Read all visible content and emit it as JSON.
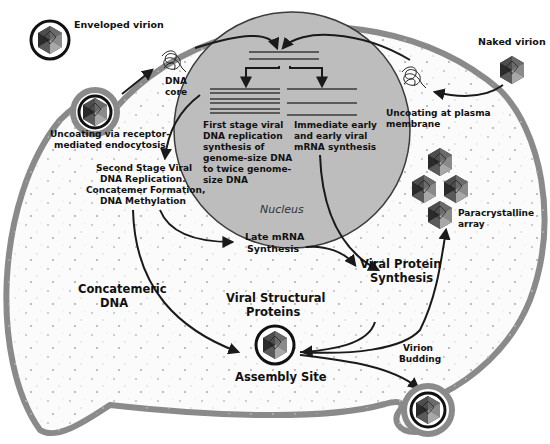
{
  "colors": {
    "background": "#ffffff",
    "cytoplasm": "#fbfbfb",
    "membrane": "#8a8a8a",
    "nucleus": "#bdbdbd",
    "nucleus_border": "#3a3a3a",
    "arrow": "#1a1a1a",
    "virion_dark": "#2e2e2e",
    "virion_light": "#9a9a9a"
  },
  "labels": {
    "enveloped_virion": "Enveloped virion",
    "naked_virion": "Naked virion",
    "dna_core": [
      "DNA",
      "core"
    ],
    "uncoating_endocytosis": [
      "Uncoating via receptor-",
      "mediated endocytosis"
    ],
    "uncoating_plasma": [
      "Uncoating at plasma",
      "membrane"
    ],
    "first_stage": [
      "First stage viral",
      "DNA replication",
      "synthesis of",
      "genome-size DNA",
      "to twice genome-",
      "size DNA"
    ],
    "immediate_early": [
      "Immediate early",
      "and early viral",
      "mRNA synthesis"
    ],
    "nucleus": "Nucleus",
    "second_stage": [
      "Second Stage Viral",
      "DNA Replication.",
      "Concatemer Formation,",
      "DNA Methylation"
    ],
    "late_mrna": [
      "Late mRNA",
      "Synthesis"
    ],
    "viral_protein_synthesis": [
      "Viral Protein",
      "Synthesis"
    ],
    "paracrystalline": [
      "Paracrystalline",
      "array"
    ],
    "concatemeric_dna": [
      "Concatemeric",
      "DNA"
    ],
    "viral_structural_proteins": [
      "Viral Structural",
      "Proteins"
    ],
    "assembly_site": "Assembly Site",
    "virion_budding": [
      "Virion",
      "Budding"
    ]
  },
  "icons": {
    "virion": "icosahedral-virion-icon",
    "dna_core": "tangled-dna-icon"
  }
}
